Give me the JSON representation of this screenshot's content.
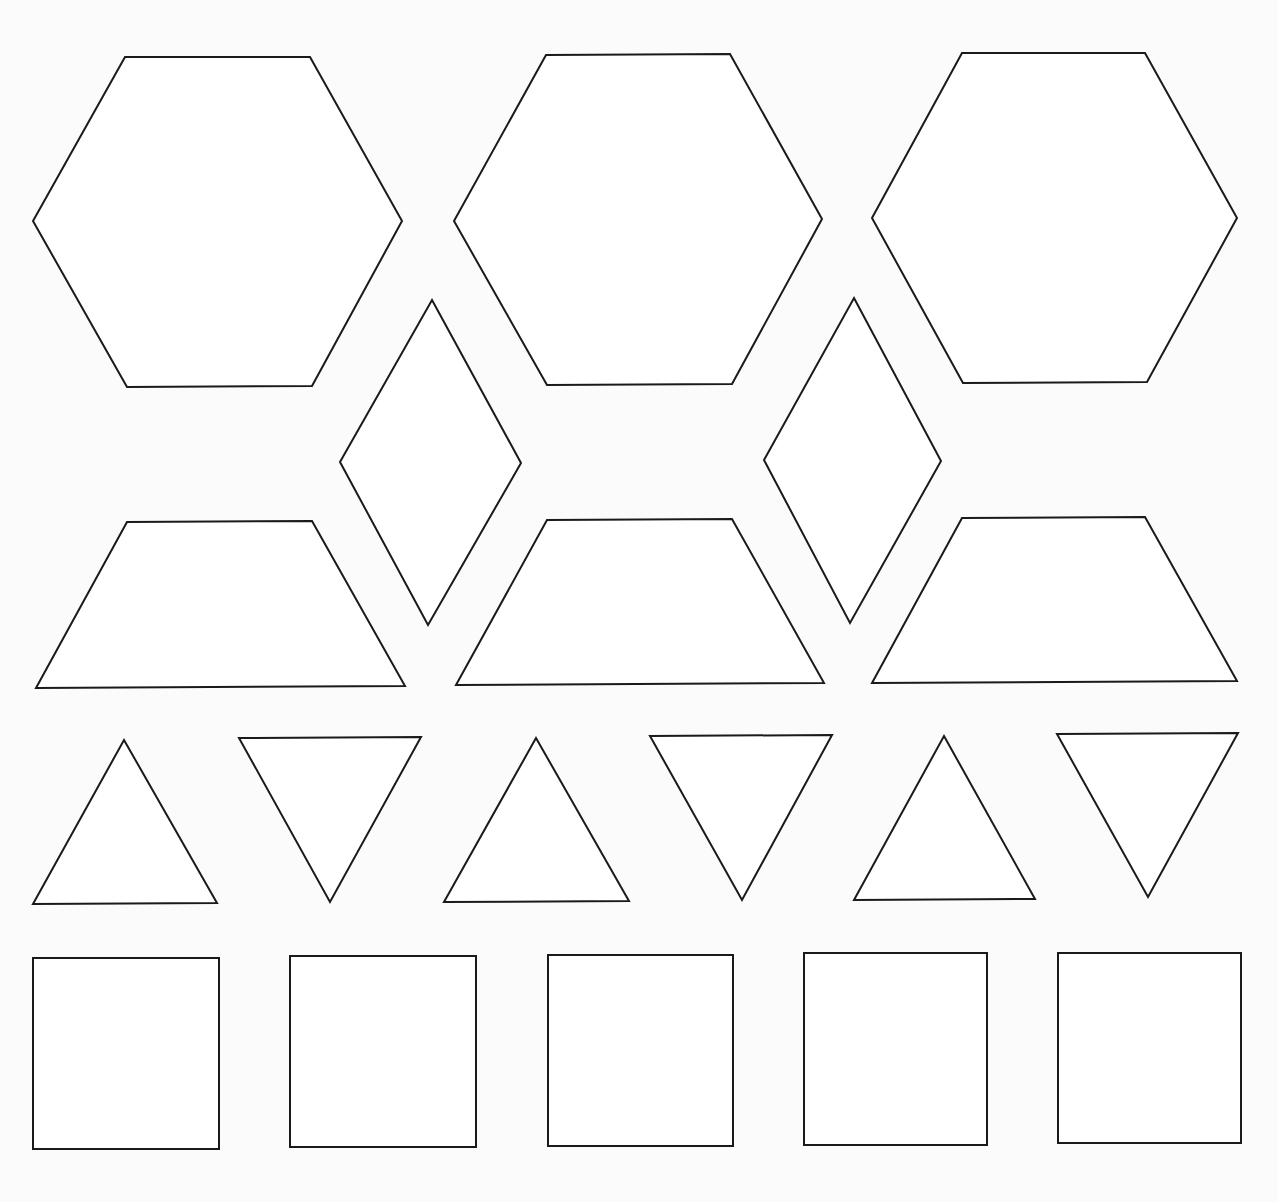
{
  "page": {
    "background_color": "#fbfbfb",
    "stroke_color": "#1a1a1a",
    "fill_color": "#ffffff",
    "top_text_cutoff": ""
  },
  "shapes": {
    "hexagons": [
      {
        "name": "hexagon-1",
        "points": "125,57 310,57 402,221 312,386 127,387 33,221"
      },
      {
        "name": "hexagon-2",
        "points": "546,55 730,54 822,219 732,384 547,385 454,221"
      },
      {
        "name": "hexagon-3",
        "points": "962,53 1145,53 1237,218 1147,382 963,383 872,218"
      }
    ],
    "rhombi": [
      {
        "name": "rhombus-1",
        "points": "432,300 521,463 428,625 340,462"
      },
      {
        "name": "rhombus-2",
        "points": "854,298 941,461 850,623 764,460"
      }
    ],
    "trapezoids": [
      {
        "name": "trapezoid-1",
        "points": "127,522 312,521 405,686 36,688"
      },
      {
        "name": "trapezoid-2",
        "points": "547,520 732,519 824,683 456,685"
      },
      {
        "name": "trapezoid-3",
        "points": "962,518 1145,517 1237,681 872,683"
      }
    ],
    "triangles": [
      {
        "name": "triangle-up-1",
        "points": "124,740 217,903 33,904"
      },
      {
        "name": "triangle-down-1",
        "points": "239,738 421,737 330,902"
      },
      {
        "name": "triangle-up-2",
        "points": "536,738 629,901 444,902"
      },
      {
        "name": "triangle-down-2",
        "points": "650,736 832,735 742,900"
      },
      {
        "name": "triangle-up-3",
        "points": "944,736 1035,899 854,900"
      },
      {
        "name": "triangle-down-3",
        "points": "1057,734 1238,733 1148,897"
      }
    ],
    "squares": [
      {
        "name": "square-1",
        "points": "33,958 219,958 219,1149 33,1149"
      },
      {
        "name": "square-2",
        "points": "290,956 476,956 476,1147 290,1147"
      },
      {
        "name": "square-3",
        "points": "548,955 733,955 733,1146 548,1146"
      },
      {
        "name": "square-4",
        "points": "804,953 987,953 987,1145 804,1145"
      },
      {
        "name": "square-5",
        "points": "1058,953 1241,953 1241,1143 1058,1143"
      }
    ]
  }
}
